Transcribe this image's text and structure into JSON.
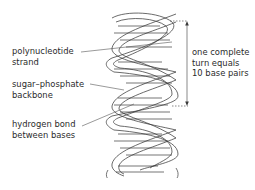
{
  "figure": {
    "labels": {
      "polynucleotide": {
        "lines": [
          "polynucleotide",
          "strand"
        ]
      },
      "backbone": {
        "lines": [
          "sugar–phosphate",
          "backbone"
        ]
      },
      "hydrogen_bond": {
        "lines": [
          "hydrogen bond",
          "between bases"
        ]
      },
      "turn": {
        "lines": [
          "one complete",
          "turn equals",
          "10 base pairs"
        ]
      }
    },
    "colors": {
      "line": "#3a3a3a",
      "text": "#2b2b2b",
      "background": "#ffffff"
    }
  }
}
